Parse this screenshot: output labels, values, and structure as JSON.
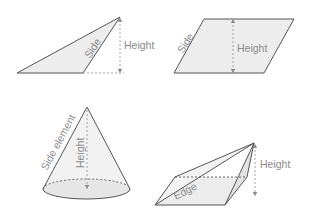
{
  "colors": {
    "stroke": "#555555",
    "fill": "#ececec",
    "dashed": "#9a9a9a",
    "label": "#8a8a8a"
  },
  "figures": {
    "triangle": {
      "side_label": "Side",
      "height_label": "Height"
    },
    "parallelogram": {
      "side_label": "Side",
      "height_label": "Height"
    },
    "cone": {
      "side_label": "Side element",
      "height_label": "Height"
    },
    "pyramid": {
      "edge_label": "Edge",
      "height_label": "Height"
    }
  }
}
